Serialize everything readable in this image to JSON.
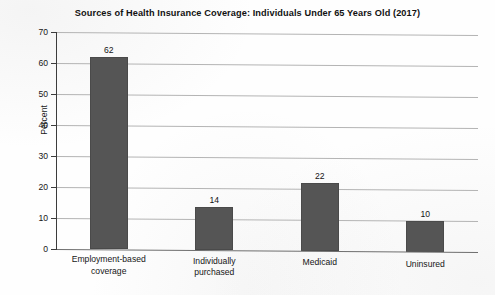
{
  "chart_data": {
    "type": "bar",
    "title": "Sources of Health Insurance Coverage: Individuals Under 65 Years Old (2017)",
    "xlabel": "",
    "ylabel": "Percent",
    "ylim": [
      0,
      70
    ],
    "ytick_step": 10,
    "yticks": [
      70,
      60,
      50,
      40,
      30,
      20,
      10,
      0
    ],
    "grid": "horizontal",
    "legend": "none",
    "bar_color": "#555555",
    "gridline_color": "#b4b4b4",
    "axis_color": "#3c3c3c",
    "categories": [
      "Employment-based coverage",
      "Individually purchased",
      "Medicaid",
      "Uninsured"
    ],
    "category_lines": [
      [
        "Employment-based",
        "coverage"
      ],
      [
        "Individually",
        "purchased"
      ],
      [
        "Medicaid"
      ],
      [
        "Uninsured"
      ]
    ],
    "values": [
      62,
      14,
      22,
      10
    ],
    "value_labels": [
      "62",
      "14",
      "22",
      "10"
    ]
  }
}
